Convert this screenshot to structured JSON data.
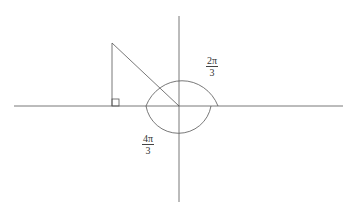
{
  "diagram": {
    "colors": {
      "stroke": "#555555",
      "background": "#ffffff"
    },
    "labels": {
      "angle_upper": {
        "numerator": "2π",
        "denominator": "3"
      },
      "angle_lower": {
        "numerator": "4π",
        "denominator": "3"
      }
    }
  }
}
